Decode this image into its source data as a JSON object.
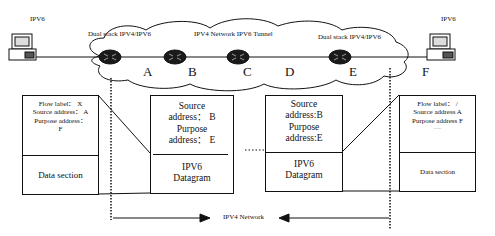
{
  "diagram": {
    "hosts": {
      "left": {
        "label": "IPV6",
        "node": "A-side host"
      },
      "right": {
        "label": "IPV6",
        "node_letter": "F"
      }
    },
    "cloud": {
      "left_label": "Dual stack IPV4/IPV6",
      "center_label": "IPV4 Network  IPV6 Tunnel",
      "right_label": "Dual stack IPV4/IPV6"
    },
    "node_letters": [
      "A",
      "B",
      "C",
      "D",
      "E",
      "F"
    ],
    "packets": [
      {
        "header_lines": [
          "Flow label： X",
          "Source address： A",
          "Purpose address：",
          "F"
        ],
        "body_lines": [
          "Data section"
        ]
      },
      {
        "header_lines": [
          "Source",
          "address： B",
          "Purpose",
          "address： E"
        ],
        "body_lines": [
          "IPV6",
          "Datagram"
        ]
      },
      {
        "header_lines": [
          "Source",
          "address:B",
          "Purpose",
          "address:E"
        ],
        "body_lines": [
          "IPV6",
          "Datagram"
        ]
      },
      {
        "header_lines": [
          "Flow label： /",
          "Source address A",
          "Purpose address F",
          "......"
        ],
        "body_lines": [
          "Data section"
        ]
      }
    ],
    "bottom_label": "IPV4 Network"
  }
}
